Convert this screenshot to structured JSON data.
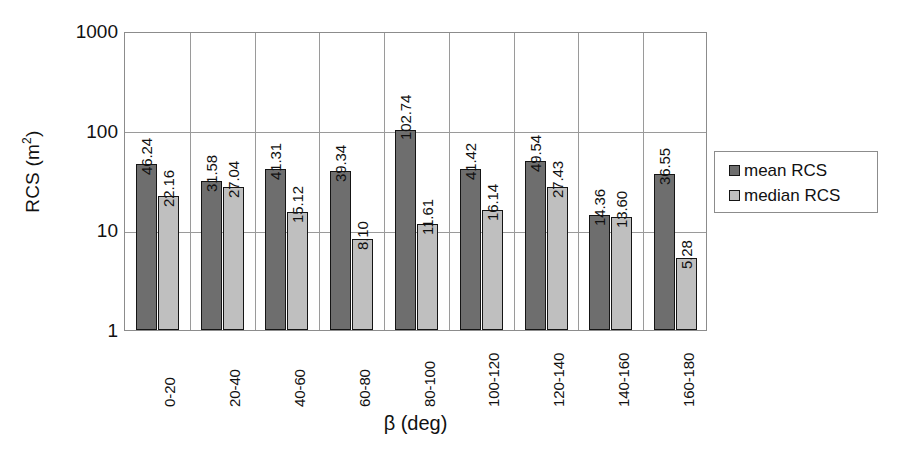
{
  "chart_data": {
    "type": "bar",
    "title": "",
    "subtitle": "",
    "xlabel": "β (deg)",
    "ylabel": "RCS (m²)",
    "ylabel_text": "RCS (m",
    "ylabel_sup": "2",
    "ylabel_close": ")",
    "yscale": "log",
    "ylim": [
      1,
      1000
    ],
    "ytick_labels": [
      "1000",
      "100",
      "10",
      "1"
    ],
    "ytick_values": [
      1000,
      100,
      10,
      1
    ],
    "grid": "horizontal-and-vertical",
    "legend_position": "right-outside",
    "categories": [
      "0-20",
      "20-40",
      "40-60",
      "60-80",
      "80-100",
      "100-120",
      "120-140",
      "140-160",
      "160-180"
    ],
    "series": [
      {
        "name": "mean RCS",
        "color": "#6e6e6e",
        "values": [
          46.24,
          31.58,
          41.31,
          39.34,
          102.74,
          41.42,
          49.54,
          14.36,
          36.55
        ],
        "labels": [
          "46.24",
          "31.58",
          "41.31",
          "39.34",
          "102.74",
          "41.42",
          "49.54",
          "14.36",
          "36.55"
        ]
      },
      {
        "name": "median RCS",
        "color": "#bfbfbf",
        "values": [
          22.16,
          27.04,
          15.12,
          8.1,
          11.61,
          16.14,
          27.43,
          13.6,
          5.28
        ],
        "labels": [
          "22.16",
          "27.04",
          "15.12",
          "8.10",
          "11.61",
          "16.14",
          "27.43",
          "13.60",
          "5.28"
        ]
      }
    ]
  },
  "legend": {
    "items": [
      {
        "label": "mean RCS",
        "color": "#6e6e6e"
      },
      {
        "label": "median RCS",
        "color": "#bfbfbf"
      }
    ]
  },
  "colors": {
    "mean": "#6e6e6e",
    "median": "#bfbfbf",
    "axis": "#8c8c8c",
    "grid": "#9a9a9a",
    "bar_outline": "#151515",
    "text": "#111111",
    "background": "#ffffff"
  }
}
